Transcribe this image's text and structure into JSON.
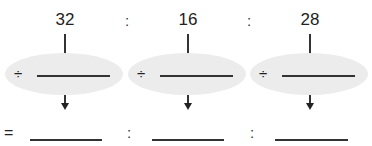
{
  "numbers": [
    "32",
    "16",
    "28"
  ],
  "separator": ":",
  "operator": "÷",
  "equals": "="
}
